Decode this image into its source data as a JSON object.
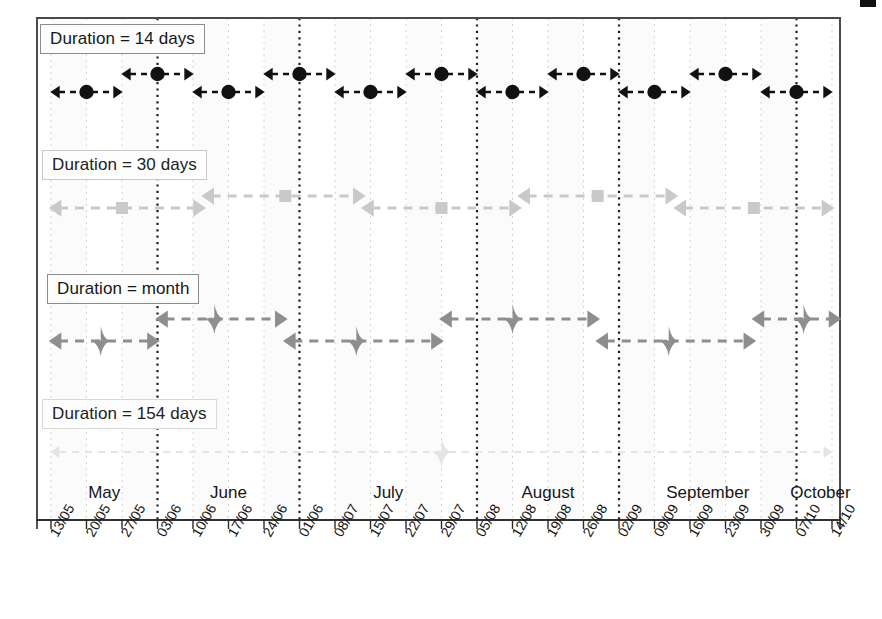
{
  "figure": {
    "type": "gantt-interval-timeline",
    "background": "#ffffff",
    "plot_border_color": "#4a4a4a"
  },
  "axis": {
    "x_tick_labels": [
      "13/05",
      "20/05",
      "27/05",
      "03/06",
      "10/06",
      "17/06",
      "24/06",
      "01/06",
      "08/07",
      "15/07",
      "22/07",
      "29/07",
      "05/08",
      "12/08",
      "19/08",
      "26/08",
      "02/09",
      "09/09",
      "16/09",
      "23/09",
      "30/09",
      "07/10",
      "14/10"
    ],
    "tick_label_rotation_deg": -60,
    "month_bands": [
      {
        "label": "May"
      },
      {
        "label": "June"
      },
      {
        "label": "July"
      },
      {
        "label": "August"
      },
      {
        "label": "September"
      },
      {
        "label": "October"
      }
    ],
    "gridlines": "light dashed vertical at every weekly tick; bold dotted vertical at month boundaries"
  },
  "rows": [
    {
      "label": "Duration = 14 days",
      "marker": "circle",
      "color": "#111111",
      "box_style": "solid"
    },
    {
      "label": "Duration = 30 days",
      "marker": "square",
      "color": "#c9c9c9",
      "box_style": "faint"
    },
    {
      "label": "Duration = month",
      "marker": "diamond",
      "color": "#8e8e8e",
      "box_style": "solid"
    },
    {
      "label": "Duration = 154 days",
      "marker": "diamond",
      "color": "#e4e4e4",
      "box_style": "vfaint"
    }
  ],
  "chart_data": {
    "type": "line",
    "title": "",
    "xlabel": "",
    "ylabel": "",
    "x": [
      "13/05",
      "20/05",
      "27/05",
      "03/06",
      "10/06",
      "17/06",
      "24/06",
      "01/06",
      "08/07",
      "15/07",
      "22/07",
      "29/07",
      "05/08",
      "12/08",
      "19/08",
      "26/08",
      "02/09",
      "09/09",
      "16/09",
      "23/09",
      "30/09",
      "07/10",
      "14/10"
    ],
    "xlim": [
      0,
      22
    ],
    "grid": true,
    "legend_position": "inline-row-labels",
    "series": [
      {
        "name": "Duration = 14 days",
        "marker": "circle",
        "color": "#111111",
        "intervals": [
          {
            "start": 0.0,
            "center": 1.0,
            "end": 2.0,
            "level": "low"
          },
          {
            "start": 2.0,
            "center": 3.0,
            "end": 4.0,
            "level": "high"
          },
          {
            "start": 4.0,
            "center": 5.0,
            "end": 6.0,
            "level": "low"
          },
          {
            "start": 6.0,
            "center": 7.0,
            "end": 8.0,
            "level": "high"
          },
          {
            "start": 8.0,
            "center": 9.0,
            "end": 10.0,
            "level": "low"
          },
          {
            "start": 10.0,
            "center": 11.0,
            "end": 12.0,
            "level": "high"
          },
          {
            "start": 12.0,
            "center": 13.0,
            "end": 14.0,
            "level": "low"
          },
          {
            "start": 14.0,
            "center": 15.0,
            "end": 16.0,
            "level": "high"
          },
          {
            "start": 16.0,
            "center": 17.0,
            "end": 18.0,
            "level": "low"
          },
          {
            "start": 18.0,
            "center": 19.0,
            "end": 20.0,
            "level": "high"
          },
          {
            "start": 20.0,
            "center": 21.0,
            "end": 22.0,
            "level": "low"
          }
        ]
      },
      {
        "name": "Duration = 30 days",
        "marker": "square",
        "color": "#c9c9c9",
        "intervals": [
          {
            "start": 0.0,
            "center": 2.0,
            "end": 4.3,
            "level": "low"
          },
          {
            "start": 4.3,
            "center": 6.6,
            "end": 8.8,
            "level": "high"
          },
          {
            "start": 8.8,
            "center": 11.0,
            "end": 13.2,
            "level": "low"
          },
          {
            "start": 13.2,
            "center": 15.4,
            "end": 17.6,
            "level": "high"
          },
          {
            "start": 17.6,
            "center": 19.8,
            "end": 22.0,
            "level": "low"
          }
        ]
      },
      {
        "name": "Duration = month",
        "marker": "diamond",
        "color": "#8e8e8e",
        "intervals": [
          {
            "start": 0.0,
            "center": 1.4,
            "end": 3.0,
            "level": "low"
          },
          {
            "start": 3.0,
            "center": 4.6,
            "end": 6.6,
            "level": "high"
          },
          {
            "start": 6.6,
            "center": 8.6,
            "end": 11.0,
            "level": "low"
          },
          {
            "start": 11.0,
            "center": 13.0,
            "end": 15.4,
            "level": "high"
          },
          {
            "start": 15.4,
            "center": 17.4,
            "end": 19.8,
            "level": "low"
          },
          {
            "start": 19.8,
            "center": 21.2,
            "end": 22.2,
            "level": "high"
          }
        ]
      },
      {
        "name": "Duration = 154 days",
        "marker": "diamond",
        "color": "#e4e4e4",
        "intervals": [
          {
            "start": 0.0,
            "center": 11.0,
            "end": 22.0,
            "level": "low"
          }
        ]
      }
    ]
  }
}
